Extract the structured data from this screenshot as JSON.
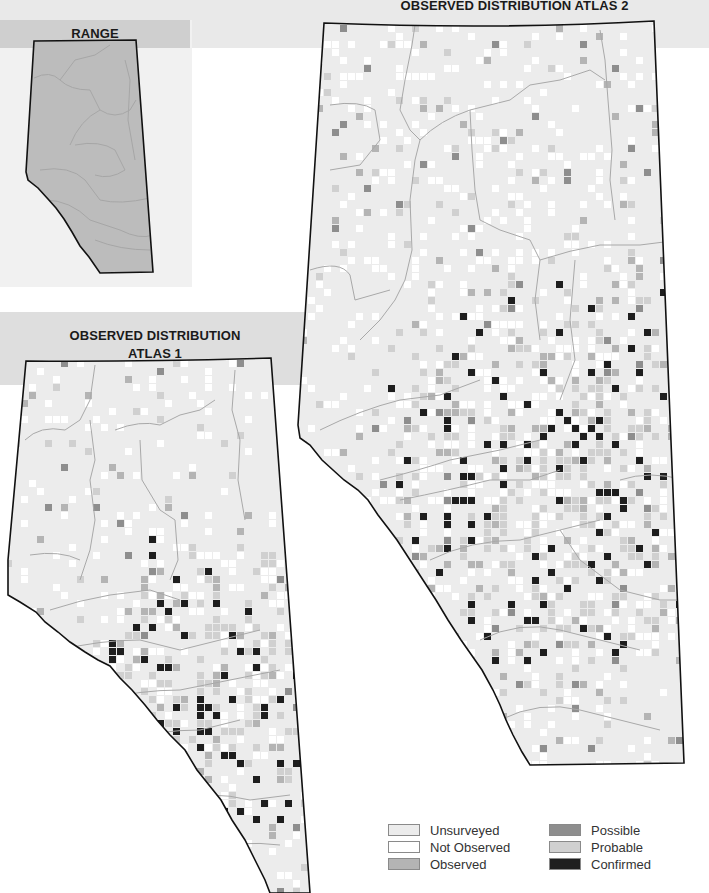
{
  "titles": {
    "range": "RANGE",
    "atlas2": "OBSERVED DISTRIBUTION ATLAS 2",
    "atlas1_line1": "OBSERVED DISTRIBUTION",
    "atlas1_line2": "ATLAS 1"
  },
  "legend": [
    {
      "label": "Unsurveyed",
      "color": "#ececec"
    },
    {
      "label": "Not Observed",
      "color": "#ffffff"
    },
    {
      "label": "Observed",
      "color": "#b4b4b4"
    },
    {
      "label": "Possible",
      "color": "#8e8e8e"
    },
    {
      "label": "Probable",
      "color": "#d0d0d0"
    },
    {
      "label": "Confirmed",
      "color": "#1e1e1e"
    }
  ],
  "colors": {
    "range_fill": "#bcbcbc",
    "unsurveyed": "#ececec",
    "outline": "#111111",
    "river": "#a8a8a8"
  }
}
